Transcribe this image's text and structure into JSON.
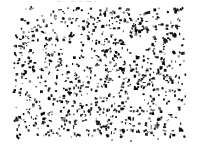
{
  "image": {
    "description": "Random black speckle noise pattern (stipple texture) on a white background with white margins",
    "width": 198,
    "height": 148,
    "background_color": "#ffffff",
    "dot_color": "#000000",
    "noise_region": {
      "x": 14,
      "y": 8,
      "width": 172,
      "height": 129
    },
    "dot_count": 880,
    "dot_size_min": 0.9,
    "dot_size_max": 3.0,
    "large_blob_count": 28,
    "large_blob_size_max": 4.5,
    "cluster_probability": 0.22,
    "gray_dot_probability": 0.18,
    "gray_dot_color": "#555555",
    "stray_bottom_dots": [
      {
        "x": 112,
        "y": 140
      },
      {
        "x": 131,
        "y": 141
      },
      {
        "x": 158,
        "y": 139
      }
    ],
    "top_faint_marks": [
      {
        "x": 57,
        "y": 1,
        "w": 4,
        "h": 1
      },
      {
        "x": 71,
        "y": 1,
        "w": 3,
        "h": 1
      },
      {
        "x": 79,
        "y": 1,
        "w": 3,
        "h": 1
      },
      {
        "x": 86,
        "y": 1,
        "w": 6,
        "h": 1
      },
      {
        "x": 94,
        "y": 1,
        "w": 2,
        "h": 1
      }
    ],
    "faint_mark_color": "#c9c9c9",
    "seed": 20240613
  }
}
